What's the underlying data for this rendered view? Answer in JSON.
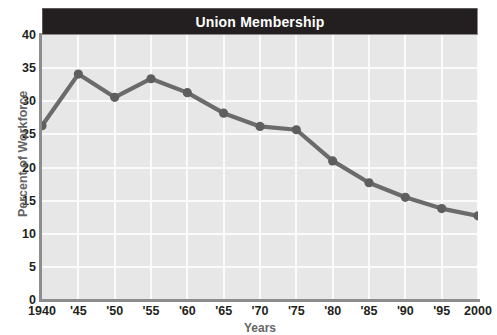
{
  "title": "Union Membership",
  "chart_data": {
    "type": "line",
    "title": "Union Membership",
    "xlabel": "Years",
    "ylabel": "Percent of Workforce",
    "categories": [
      "1940",
      "'45",
      "'50",
      "'55",
      "'60",
      "'65",
      "'70",
      "'75",
      "'80",
      "'85",
      "'90",
      "'95",
      "2000"
    ],
    "x_values": [
      1940,
      1945,
      1950,
      1955,
      1960,
      1965,
      1970,
      1975,
      1980,
      1985,
      1990,
      1995,
      2000
    ],
    "values": [
      26.3,
      34.1,
      30.6,
      33.4,
      31.3,
      28.2,
      26.2,
      25.7,
      21.0,
      17.7,
      15.5,
      13.8,
      12.7
    ],
    "series": [
      {
        "name": "Union Membership",
        "values": [
          26.3,
          34.1,
          30.6,
          33.4,
          31.3,
          28.2,
          26.2,
          25.7,
          21.0,
          17.7,
          15.5,
          13.8,
          12.7
        ]
      }
    ],
    "ylim": [
      0,
      40
    ],
    "y_ticks": [
      0,
      5,
      10,
      15,
      20,
      25,
      30,
      35,
      40
    ],
    "y_tick_labels": [
      "0",
      "5",
      "10",
      "15",
      "20",
      "25",
      "30",
      "35",
      "40"
    ],
    "xlim": [
      1940,
      2000
    ],
    "grid": true,
    "legend": false,
    "legend_position": "none",
    "marker": "circle",
    "colors": {
      "line": "#6b6b6b",
      "marker": "#5e5e5e",
      "plot_background": "#e7e7e7",
      "gridline": "#fbfbfb",
      "title_band": "#231f20",
      "title_text": "#ffffff",
      "axis_line": "#8d8d8d",
      "tick_label": "#231f20",
      "axis_title": "#666666"
    }
  }
}
